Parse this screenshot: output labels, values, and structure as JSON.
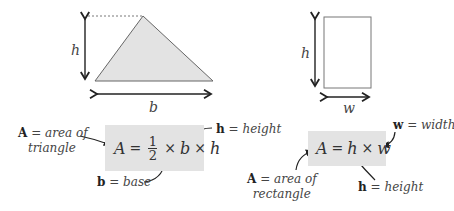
{
  "triangle": {
    "height_label": "h",
    "base_label": "b",
    "fill": "#e3e3e3",
    "formula": {
      "lhs": "A",
      "equals": "=",
      "frac_num": "1",
      "frac_den": "2",
      "times": "×",
      "b": "b",
      "h": "h"
    },
    "notes": {
      "area_var": "A",
      "area_text": " = area of",
      "area_text2": "triangle",
      "height_var": "h",
      "height_text": " = height",
      "base_var": "b",
      "base_text": " = base"
    }
  },
  "rectangle": {
    "height_label": "h",
    "width_label": "w",
    "formula": {
      "lhs": "A",
      "equals": "=",
      "h": "h",
      "times": "×",
      "w": "w"
    },
    "notes": {
      "width_var": "w",
      "width_text": " = width",
      "area_var": "A",
      "area_text": " = area of",
      "area_text2": "rectangle",
      "height_var": "h",
      "height_text": " = height"
    }
  }
}
